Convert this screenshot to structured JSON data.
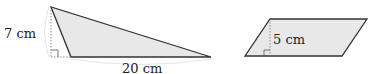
{
  "figures": {
    "triangle": {
      "height_label": "7 cm",
      "base_label": "20 cm",
      "fill": "#e8e8e8",
      "stroke": "#333333"
    },
    "parallelogram": {
      "height_label": "5 cm",
      "fill": "#e8e8e8",
      "stroke": "#333333"
    }
  }
}
